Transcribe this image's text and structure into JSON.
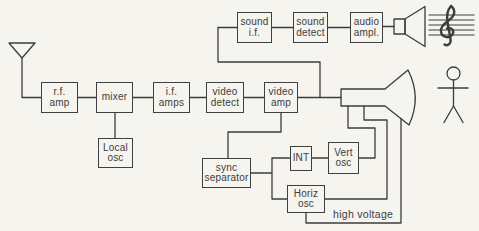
{
  "colors": {
    "background": "#f5f4ef",
    "line": "#3c3c3c"
  },
  "blocks": {
    "rf_amp": {
      "label": "r.f.\namp"
    },
    "mixer": {
      "label": "mixer"
    },
    "if_amps": {
      "label": "i.f.\namps"
    },
    "video_detect": {
      "label": "video\ndetect"
    },
    "video_amp": {
      "label": "video\namp"
    },
    "local_osc": {
      "label": "Local\nosc"
    },
    "sound_if": {
      "label": "sound\ni.f."
    },
    "sound_detect": {
      "label": "sound\ndetect"
    },
    "audio_ampl": {
      "label": "audio\nampl."
    },
    "sync_separator": {
      "label": "sync\nseparator"
    },
    "int": {
      "label": "INT"
    },
    "vert_osc": {
      "label": "Vert\nosc"
    },
    "horiz_osc": {
      "label": "Horiz\nosc"
    }
  },
  "annotations": {
    "high_voltage": "high voltage"
  },
  "icons": {
    "antenna": "antenna-icon",
    "speaker": "speaker-icon",
    "music": "music-staff-treble-clef-icon",
    "crt": "picture-tube-icon",
    "person": "viewer-person-icon"
  }
}
